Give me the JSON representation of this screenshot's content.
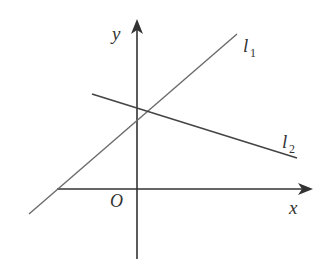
{
  "diagram": {
    "type": "coordinate-plane",
    "axes": {
      "x_label": "x",
      "y_label": "y",
      "origin_label": "O"
    },
    "lines": [
      {
        "name": "l1",
        "letter": "l",
        "subscript": "1",
        "slope": "positive",
        "y_intercept": "positive"
      },
      {
        "name": "l2",
        "letter": "l",
        "subscript": "2",
        "slope": "negative",
        "y_intercept": "positive"
      }
    ],
    "colors": {
      "axis": "#333333",
      "l1": "#6b6b6b",
      "l2": "#444444"
    }
  }
}
